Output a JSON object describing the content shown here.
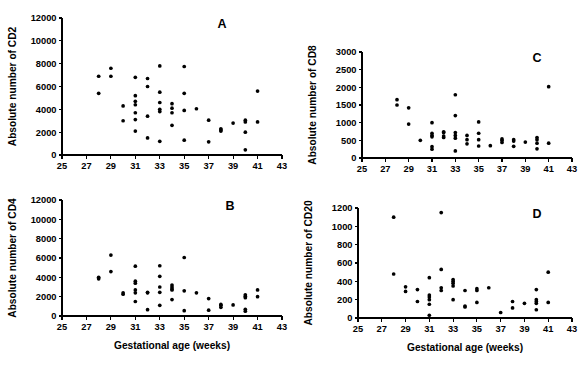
{
  "figure": {
    "type": "multi-panel-scatter",
    "panel_count": 4,
    "background_color": "#ffffff",
    "marker_color": "#000000",
    "axis_color": "#000000"
  },
  "chart_data": [
    {
      "type": "scatter",
      "panel_label": "A",
      "title": "",
      "xlabel": "",
      "ylabel": "Absolute number of CD2",
      "xlim": [
        25,
        43
      ],
      "ylim": [
        0,
        12000
      ],
      "xticks": [
        25,
        27,
        29,
        31,
        33,
        35,
        37,
        39,
        41,
        43
      ],
      "xticklabels": [
        "25",
        "27",
        "29",
        "31",
        "33",
        "35",
        "37",
        "39",
        "41",
        "43"
      ],
      "yticks": [
        0,
        2000,
        4000,
        6000,
        8000,
        10000,
        12000
      ],
      "yticklabels": [
        "0",
        "2000",
        "4000",
        "6000",
        "8000",
        "10000",
        "12000"
      ],
      "grid": false,
      "legend": "none",
      "x": [
        28,
        28,
        29,
        29,
        30,
        30,
        31,
        31,
        31,
        31,
        31,
        31,
        31,
        32,
        32,
        32,
        32,
        33,
        33,
        33,
        33,
        33,
        33,
        34,
        34,
        34,
        34,
        35,
        35,
        35,
        35,
        36,
        37,
        37,
        38,
        38,
        38,
        39,
        40,
        40,
        40,
        40,
        41,
        41
      ],
      "y": [
        6900,
        5400,
        7600,
        6900,
        4300,
        3000,
        6800,
        5200,
        4700,
        4400,
        3700,
        3100,
        2100,
        6700,
        6000,
        3400,
        1500,
        7800,
        5500,
        4600,
        4000,
        3800,
        1200,
        4500,
        4100,
        3700,
        2600,
        7750,
        5400,
        3900,
        1300,
        4050,
        3050,
        1150,
        2300,
        2200,
        2100,
        2800,
        3050,
        2900,
        2000,
        450,
        5600,
        2900
      ]
    },
    {
      "type": "scatter",
      "panel_label": "B",
      "title": "",
      "xlabel": "Gestational age (weeks)",
      "ylabel": "Absolute number of CD4",
      "xlim": [
        25,
        43
      ],
      "ylim": [
        0,
        12000
      ],
      "xticks": [
        25,
        27,
        29,
        31,
        33,
        35,
        37,
        39,
        41,
        43
      ],
      "xticklabels": [
        "25",
        "27",
        "29",
        "31",
        "33",
        "35",
        "37",
        "39",
        "41",
        "43"
      ],
      "yticks": [
        0,
        2000,
        4000,
        6000,
        8000,
        10000,
        12000
      ],
      "yticklabels": [
        "0",
        "2000",
        "4000",
        "6000",
        "8000",
        "10000",
        "12000"
      ],
      "grid": false,
      "legend": "none",
      "x": [
        28,
        28,
        29,
        29,
        30,
        30,
        31,
        31,
        31,
        31,
        31,
        31,
        32,
        32,
        32,
        33,
        33,
        33,
        33,
        33,
        34,
        34,
        34,
        34,
        34,
        35,
        35,
        35,
        36,
        37,
        37,
        38,
        38,
        38,
        39,
        40,
        40,
        40,
        40,
        40,
        41,
        41
      ],
      "y": [
        4000,
        3850,
        6300,
        4600,
        2400,
        2250,
        5150,
        3600,
        3400,
        2700,
        2400,
        1500,
        2450,
        2400,
        650,
        5200,
        4100,
        3000,
        2450,
        1100,
        3200,
        3000,
        2800,
        2700,
        1700,
        6050,
        2600,
        550,
        2400,
        1800,
        600,
        1200,
        1100,
        900,
        1150,
        2200,
        2050,
        1900,
        700,
        500,
        2700,
        2000
      ]
    },
    {
      "type": "scatter",
      "panel_label": "C",
      "title": "",
      "xlabel": "",
      "ylabel": "Absolute number of CD8",
      "xlim": [
        25,
        43
      ],
      "ylim": [
        0,
        3000
      ],
      "xticks": [
        25,
        27,
        29,
        31,
        33,
        35,
        37,
        39,
        41,
        43
      ],
      "xticklabels": [
        "25",
        "27",
        "29",
        "31",
        "33",
        "35",
        "37",
        "39",
        "41",
        "43"
      ],
      "yticks": [
        0,
        500,
        1000,
        1500,
        2000,
        2500,
        3000
      ],
      "yticklabels": [
        "0",
        "500",
        "1000",
        "1500",
        "2000",
        "2500",
        "3000"
      ],
      "grid": false,
      "legend": "none",
      "x": [
        28,
        28,
        29,
        29,
        30,
        31,
        31,
        31,
        31,
        31,
        31,
        32,
        32,
        32,
        32,
        33,
        33,
        33,
        33,
        33,
        33,
        34,
        34,
        34,
        35,
        35,
        35,
        35,
        36,
        37,
        37,
        37,
        38,
        38,
        38,
        39,
        40,
        40,
        40,
        40,
        41,
        41
      ],
      "y": [
        1650,
        1500,
        1420,
        960,
        500,
        1000,
        700,
        640,
        600,
        320,
        250,
        740,
        720,
        620,
        580,
        1790,
        1200,
        720,
        640,
        560,
        200,
        640,
        520,
        400,
        1020,
        700,
        520,
        340,
        350,
        540,
        500,
        440,
        520,
        480,
        330,
        450,
        580,
        520,
        420,
        260,
        2020,
        420
      ]
    },
    {
      "type": "scatter",
      "panel_label": "D",
      "title": "",
      "xlabel": "Gestational age (weeks)",
      "ylabel": "Absolute number of CD20",
      "xlim": [
        25,
        43
      ],
      "ylim": [
        0,
        1200
      ],
      "xticks": [
        25,
        27,
        29,
        31,
        33,
        35,
        37,
        39,
        41,
        43
      ],
      "xticklabels": [
        "25",
        "27",
        "29",
        "31",
        "33",
        "35",
        "37",
        "39",
        "41",
        "43"
      ],
      "yticks": [
        0,
        200,
        400,
        600,
        800,
        1000,
        1200
      ],
      "yticklabels": [
        "0",
        "200",
        "400",
        "600",
        "800",
        "1000",
        "1200"
      ],
      "grid": false,
      "legend": "none",
      "x": [
        28,
        28,
        29,
        29,
        30,
        30,
        31,
        31,
        31,
        31,
        31,
        31,
        32,
        32,
        32,
        32,
        33,
        33,
        33,
        33,
        33,
        34,
        34,
        34,
        35,
        35,
        35,
        36,
        37,
        38,
        38,
        39,
        40,
        40,
        40,
        40,
        40,
        41,
        41
      ],
      "y": [
        1100,
        480,
        340,
        290,
        310,
        180,
        440,
        250,
        230,
        200,
        150,
        30,
        1150,
        530,
        330,
        300,
        420,
        400,
        380,
        350,
        200,
        300,
        130,
        120,
        320,
        300,
        170,
        330,
        60,
        180,
        110,
        160,
        310,
        200,
        180,
        160,
        90,
        500,
        170
      ]
    }
  ]
}
